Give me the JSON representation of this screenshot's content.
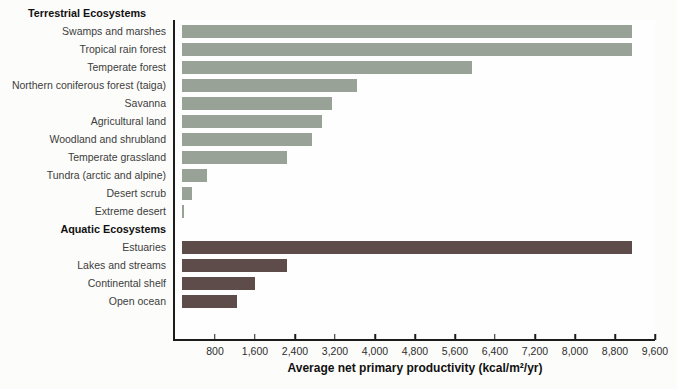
{
  "page": {
    "background": "#fcfcfa",
    "axis_color": "#1c1c1c"
  },
  "chart_data": {
    "type": "bar",
    "orientation": "horizontal",
    "title": "",
    "xlabel": "Average net primary productivity (kcal/m²/yr)",
    "ylabel": "",
    "xlim": [
      0,
      9600
    ],
    "x_ticks": [
      800,
      1600,
      2400,
      3200,
      4000,
      4800,
      5600,
      6400,
      7200,
      8000,
      8800,
      9600
    ],
    "x_tick_labels": [
      "800",
      "1,600",
      "2,400",
      "3,200",
      "4,000",
      "4,800",
      "5,600",
      "6,400",
      "7,200",
      "8,000",
      "8,800",
      "9,600"
    ],
    "grid": false,
    "legend": false,
    "groups": [
      {
        "label": "Terrestrial Ecosystems",
        "color": "#98a296",
        "items": [
          {
            "label": "Swamps and marshes",
            "value": 9000
          },
          {
            "label": "Tropical rain forest",
            "value": 9000
          },
          {
            "label": "Temperate forest",
            "value": 5800
          },
          {
            "label": "Northern coniferous forest (taiga)",
            "value": 3500
          },
          {
            "label": "Savanna",
            "value": 3000
          },
          {
            "label": "Agricultural land",
            "value": 2800
          },
          {
            "label": "Woodland and shrubland",
            "value": 2600
          },
          {
            "label": "Temperate grassland",
            "value": 2100
          },
          {
            "label": "Tundra (arctic and alpine)",
            "value": 500
          },
          {
            "label": "Desert scrub",
            "value": 200
          },
          {
            "label": "Extreme desert",
            "value": 50
          }
        ]
      },
      {
        "label": "Aquatic Ecosystems",
        "color": "#5e4c4a",
        "items": [
          {
            "label": "Estuaries",
            "value": 9000
          },
          {
            "label": "Lakes and streams",
            "value": 2100
          },
          {
            "label": "Continental shelf",
            "value": 1450
          },
          {
            "label": "Open ocean",
            "value": 1100
          }
        ]
      }
    ]
  }
}
